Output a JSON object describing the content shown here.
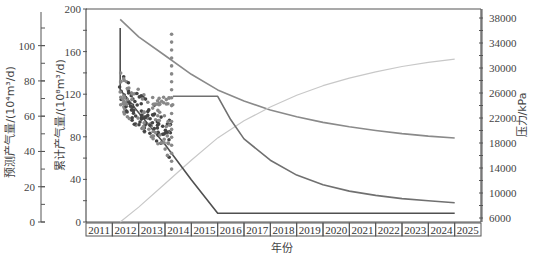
{
  "chart_data": {
    "type": "line",
    "title": "",
    "xlabel": "年份",
    "x": [
      "2011",
      "2012",
      "2013",
      "2014",
      "2015",
      "2016",
      "2017",
      "2018",
      "2019",
      "2020",
      "2021",
      "2022",
      "2023",
      "2024",
      "2025"
    ],
    "axes": {
      "left_outer": {
        "label": "预测产气量/(10⁴m³/d)",
        "ticks": [
          0,
          20,
          40,
          60,
          80,
          100
        ],
        "range": [
          0,
          110
        ]
      },
      "left_inner": {
        "label": "累计产气量/(10⁸m³/d)",
        "ticks": [
          0,
          40,
          80,
          120,
          160,
          200
        ],
        "range": [
          0,
          200
        ]
      },
      "right": {
        "label": "压力/kPa",
        "ticks": [
          6000,
          10000,
          14000,
          18000,
          22000,
          26000,
          30000,
          34000,
          38000
        ],
        "range": [
          6000,
          38000
        ]
      }
    },
    "series": [
      {
        "name": "压力 (pressure, kPa)",
        "axis": "right",
        "color": "#8a8a8a",
        "points": [
          [
            2012.3,
            37800
          ],
          [
            2013,
            35000
          ],
          [
            2014,
            32000
          ],
          [
            2015,
            29000
          ],
          [
            2016,
            26500
          ],
          [
            2017,
            24700
          ],
          [
            2018,
            23300
          ],
          [
            2019,
            22200
          ],
          [
            2020,
            21300
          ],
          [
            2021,
            20600
          ],
          [
            2022,
            20000
          ],
          [
            2023,
            19500
          ],
          [
            2024,
            19100
          ],
          [
            2025,
            18800
          ]
        ]
      },
      {
        "name": "累计产气量 (cumulative gas)",
        "axis": "left_inner",
        "color": "#c8c8c8",
        "points": [
          [
            2012.3,
            0
          ],
          [
            2013,
            14
          ],
          [
            2014,
            36
          ],
          [
            2015,
            58
          ],
          [
            2016,
            79
          ],
          [
            2017,
            95
          ],
          [
            2018,
            108
          ],
          [
            2019,
            119
          ],
          [
            2020,
            128
          ],
          [
            2021,
            135
          ],
          [
            2022,
            141
          ],
          [
            2023,
            146
          ],
          [
            2024,
            150
          ],
          [
            2025,
            153
          ]
        ]
      },
      {
        "name": "预测产气量 (forecast rate)",
        "axis": "left_outer",
        "color": "#505050",
        "points": [
          [
            2012.3,
            110
          ],
          [
            2012.3,
            75
          ],
          [
            2013,
            62
          ],
          [
            2014,
            44
          ],
          [
            2015,
            24
          ],
          [
            2016,
            5
          ],
          [
            2017,
            5
          ],
          [
            2025,
            5
          ]
        ]
      },
      {
        "name": "产能上限 (plateau/decline)",
        "axis": "left_inner",
        "color": "#707070",
        "points": [
          [
            2014.3,
            118
          ],
          [
            2016,
            118
          ],
          [
            2016.5,
            96
          ],
          [
            2017,
            78
          ],
          [
            2018,
            58
          ],
          [
            2019,
            44
          ],
          [
            2020,
            35
          ],
          [
            2021,
            29
          ],
          [
            2022,
            25
          ],
          [
            2023,
            22
          ],
          [
            2024,
            20
          ],
          [
            2025,
            18
          ]
        ]
      },
      {
        "name": "实测产气量 (observed)",
        "axis": "left_outer",
        "type": "scatter",
        "color": "#555555",
        "x_range": [
          2012.3,
          2014.4
        ],
        "y_range": [
          28,
          110
        ]
      }
    ],
    "grid": false,
    "legend": "none"
  },
  "labels": {
    "x_title": "年份",
    "left_outer_title": "预测产气量/(10⁴m³/d)",
    "left_inner_title": "累计产气量/(10⁸m³/d)",
    "right_title": "压力/kPa"
  }
}
